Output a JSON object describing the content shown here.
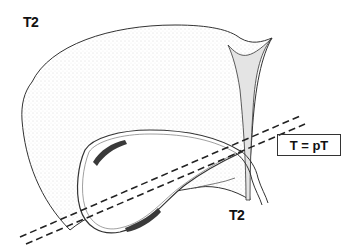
{
  "diagram": {
    "labels": {
      "top_left": "T2",
      "bottom": "T2",
      "equation_box": "T = pT"
    },
    "colors": {
      "line": "#333333",
      "stipple": "#cfcfcf",
      "tumor": "#3a3a3a",
      "background": "#ffffff"
    },
    "elements": [
      "liver-outline",
      "gallbladder",
      "cystic-duct",
      "tumor-deposits",
      "resection-plane-dashed-lines",
      "ligament"
    ]
  }
}
